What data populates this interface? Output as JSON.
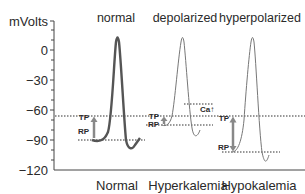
{
  "axis": {
    "unit_label": "mVolts",
    "ticks": [
      "0",
      "−30",
      "−60",
      "−90",
      "−120"
    ],
    "tick_values": [
      0,
      -30,
      -60,
      -90,
      -120
    ]
  },
  "panels": [
    {
      "title": "normal",
      "condition": "Normal",
      "tp_label": "TP",
      "rp_label": "RP",
      "tp_mv": -66,
      "rp_mv": -90
    },
    {
      "title": "depolarized",
      "condition": "Hyperkalemia",
      "tp_label": "TP",
      "rp_label": "RP",
      "ca_label": "Ca↑",
      "tp_mv": -66,
      "rp_mv": -75,
      "ca_mv": -55
    },
    {
      "title": "hyperpolarized",
      "condition": "Hypokalemia",
      "tp_label": "TP",
      "rp_label": "RP",
      "tp_mv": -66,
      "rp_mv": -102
    }
  ],
  "colors": {
    "normal_trace": "#555555",
    "thin_trace": "#777777",
    "arrow": "#888888",
    "text": "#2a2a2a"
  }
}
